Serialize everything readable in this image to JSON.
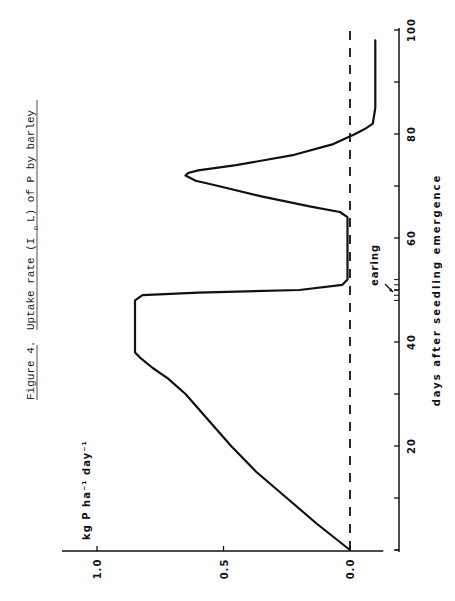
{
  "chart_data": {
    "type": "line",
    "orientation": "rotated 90° counter-clockwise (x-axis runs vertically on the right, y-axis horizontally at the bottom)",
    "title_parts": {
      "figure_label": "Figure 4.",
      "text_before": "Uptake rate (I",
      "subscript": "n",
      "text_after": "L) of P by barley"
    },
    "xlabel": "days after seedling emergence",
    "ylabel": "kg P ha⁻¹ day⁻¹",
    "xlim": [
      0,
      100
    ],
    "ylim": [
      -0.12,
      1.05
    ],
    "x_ticks": [
      0,
      20,
      40,
      60,
      80,
      100
    ],
    "x_tick_labels": [
      "20",
      "40",
      "60",
      "80",
      "100"
    ],
    "x_minor_ticks": [
      10,
      30,
      50,
      70,
      90
    ],
    "y_ticks": [
      0.0,
      0.5,
      1.0
    ],
    "y_tick_labels": [
      "0.0",
      "0.5",
      "1.0"
    ],
    "grid": false,
    "legend": null,
    "reference_line": {
      "y": 0.0,
      "style": "dashed"
    },
    "annotations": [
      {
        "text": "earing",
        "x": 50,
        "note": "arrow pointing to axis near day 50, with small tick cluster at days 48–52"
      }
    ],
    "series": [
      {
        "name": "Uptake rate of P",
        "x": [
          0,
          5,
          10,
          15,
          20,
          25,
          30,
          33,
          35,
          37,
          38,
          45,
          48,
          49,
          49.5,
          50,
          51,
          52,
          60,
          64,
          65,
          66,
          68,
          70,
          71,
          72,
          72.5,
          73,
          74,
          76,
          78,
          80,
          81,
          82,
          85,
          90,
          95,
          98
        ],
        "y": [
          0.0,
          0.13,
          0.25,
          0.37,
          0.47,
          0.56,
          0.65,
          0.72,
          0.78,
          0.83,
          0.85,
          0.85,
          0.85,
          0.82,
          0.6,
          0.2,
          0.03,
          0.01,
          0.01,
          0.01,
          0.04,
          0.15,
          0.35,
          0.52,
          0.61,
          0.65,
          0.64,
          0.6,
          0.45,
          0.22,
          0.07,
          -0.02,
          -0.06,
          -0.09,
          -0.1,
          -0.1,
          -0.1,
          -0.1
        ]
      }
    ]
  }
}
